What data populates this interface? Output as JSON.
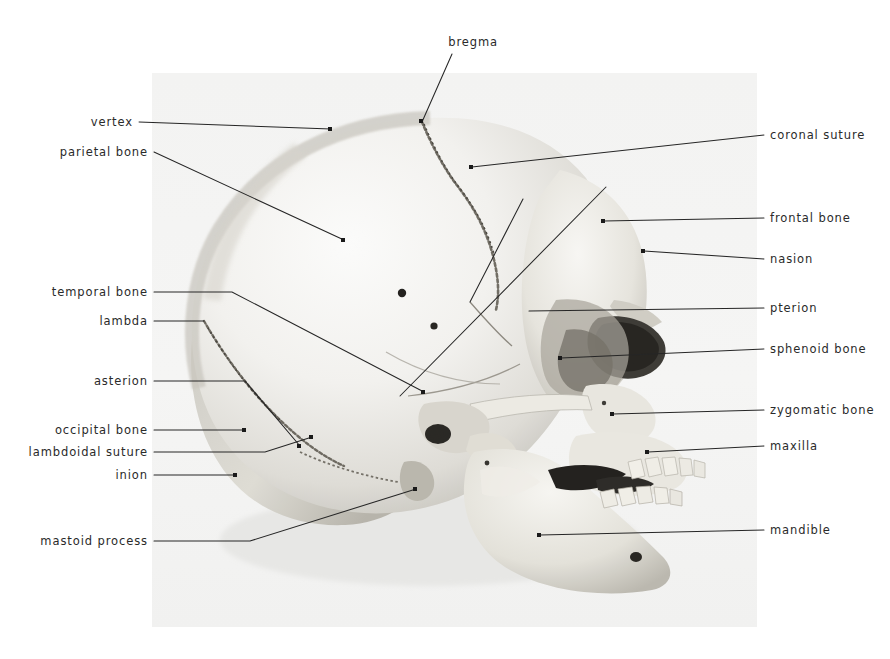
{
  "figure": {
    "photo": {
      "x": 152,
      "y": 73,
      "width": 605,
      "height": 554,
      "background": "#f4f4f4",
      "page_background": "#ffffff"
    },
    "text_color": "#2a2a2a",
    "leader_color": "#262626"
  },
  "labels": {
    "bregma": "bregma",
    "vertex": "vertex",
    "parietal_bone": "parietal bone",
    "temporal_bone": "temporal bone",
    "lambda": "lambda",
    "asterion": "asterion",
    "occipital_bone": "occipital bone",
    "lambdoidal_suture": "lambdoidal suture",
    "inion": "inion",
    "mastoid_process": "mastoid process",
    "coronal_suture": "coronal suture",
    "frontal_bone": "frontal bone",
    "nasion": "nasion",
    "pterion": "pterion",
    "sphenoid_bone": "sphenoid bone",
    "zygomatic_bone": "zygomatic bone",
    "maxilla": "maxilla",
    "mandible": "mandible"
  },
  "annotations": [
    {
      "key": "bregma",
      "side": "top",
      "text_x": 455,
      "text_y": 46,
      "line": "M 452 54 L 422 122",
      "dot": [
        422,
        122
      ]
    },
    {
      "key": "vertex",
      "side": "left",
      "text_x": 133,
      "text_y": 126,
      "line": "M 139 122 L 331 129",
      "dot": [
        331,
        129
      ]
    },
    {
      "key": "parietal_bone",
      "side": "left",
      "text_x": 148,
      "text_y": 156,
      "line": "M 154 152 L 344 240",
      "dot": [
        344,
        240
      ]
    },
    {
      "key": "temporal_bone",
      "side": "left",
      "text_x": 148,
      "text_y": 296,
      "line": "M 154 292 L 232 292 L 424 392",
      "dot": [
        424,
        392
      ]
    },
    {
      "key": "lambda",
      "side": "left",
      "text_x": 148,
      "text_y": 325,
      "line": "M 154 321 L 204 321",
      "dot": [
        204,
        321
      ]
    },
    {
      "key": "asterion",
      "side": "left",
      "text_x": 148,
      "text_y": 385,
      "line": "M 154 381 L 245 381 L 300 446",
      "dot": [
        300,
        446
      ]
    },
    {
      "key": "occipital_bone",
      "side": "left",
      "text_x": 148,
      "text_y": 434,
      "line": "M 154 430 L 245 430",
      "dot": [
        245,
        430
      ]
    },
    {
      "key": "lambdoidal_suture",
      "side": "left",
      "text_x": 148,
      "text_y": 456,
      "line": "M 154 452 L 265 452 L 312 437",
      "dot": [
        312,
        437
      ]
    },
    {
      "key": "inion",
      "side": "left",
      "text_x": 148,
      "text_y": 479,
      "line": "M 154 475 L 236 475",
      "dot": [
        236,
        475
      ]
    },
    {
      "key": "mastoid_process",
      "side": "left",
      "text_x": 148,
      "text_y": 545,
      "line": "M 154 541 L 250 541 L 416 489",
      "dot": [
        416,
        489
      ]
    },
    {
      "key": "coronal_suture",
      "side": "right",
      "text_x": 770,
      "text_y": 139,
      "line": "M 764 135 L 472 167",
      "dot": [
        472,
        167
      ]
    },
    {
      "key": "frontal_bone",
      "side": "right",
      "text_x": 770,
      "text_y": 222,
      "line": "M 764 218 L 604 221",
      "dot": [
        604,
        221
      ]
    },
    {
      "key": "nasion",
      "side": "right",
      "text_x": 770,
      "text_y": 263,
      "line": "M 764 259 L 644 251",
      "dot": [
        644,
        251
      ]
    },
    {
      "key": "pterion",
      "side": "right",
      "text_x": 770,
      "text_y": 312,
      "line": "M 764 308 L 529 311",
      "dot": [
        529,
        311
      ]
    },
    {
      "key": "sphenoid_bone",
      "side": "right",
      "text_x": 770,
      "text_y": 353,
      "line": "M 764 349 L 561 358",
      "dot": [
        561,
        358
      ]
    },
    {
      "key": "zygomatic_bone",
      "side": "right",
      "text_x": 770,
      "text_y": 414,
      "line": "M 764 410 L 613 414",
      "dot": [
        613,
        414
      ]
    },
    {
      "key": "maxilla",
      "side": "right",
      "text_x": 770,
      "text_y": 450,
      "line": "M 764 446 L 648 452",
      "dot": [
        648,
        452
      ]
    },
    {
      "key": "mandible",
      "side": "right",
      "text_x": 770,
      "text_y": 534,
      "line": "M 764 530 L 540 535",
      "dot": [
        540,
        535
      ]
    }
  ],
  "extra_leaders": [
    {
      "name": "coronal-suture-branch",
      "line": "M 523 199 L 470 302"
    },
    {
      "name": "pterion-branch",
      "line": "M 606 187 L 400 396"
    }
  ]
}
